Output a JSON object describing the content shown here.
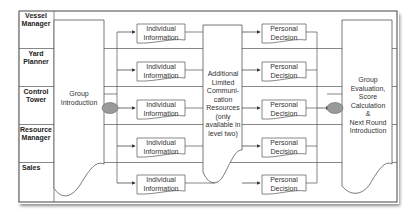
{
  "diagram": {
    "type": "swimlane-process",
    "lanes": [
      {
        "label": "Vessel Manager"
      },
      {
        "label": "Yard Planner"
      },
      {
        "label": "Control Tower"
      },
      {
        "label": "Resource Manager"
      },
      {
        "label": "Sales"
      }
    ],
    "group_intro": {
      "label": "Group Introduction"
    },
    "individual_information": [
      {
        "label": "Individual Information"
      },
      {
        "label": "Individual Information"
      },
      {
        "label": "Individual Information"
      },
      {
        "label": "Individual Information"
      },
      {
        "label": "Individual Information"
      }
    ],
    "communication": {
      "label": "Additional Limited Communi-cation Resources (only available in level two)",
      "lines": [
        "Additional",
        "Limited",
        "Communi-",
        "cation",
        "Resources",
        "(only",
        "available in",
        "level two)"
      ]
    },
    "personal_decision": [
      {
        "label": "Personal Decision"
      },
      {
        "label": "Personal Decision"
      },
      {
        "label": "Personal Decision"
      },
      {
        "label": "Personal Decision"
      },
      {
        "label": "Personal Decision"
      }
    ],
    "group_eval": {
      "label": "Group Evaluation, Score Calculation & Next Round Introduction",
      "lines": [
        "Group",
        "Evaluation,",
        "Score",
        "Calculation",
        "&",
        "Next Round",
        "Introduction"
      ]
    },
    "colors": {
      "line": "#555555",
      "junction_fill": "#9a9a9a",
      "frame": "#444444"
    }
  }
}
